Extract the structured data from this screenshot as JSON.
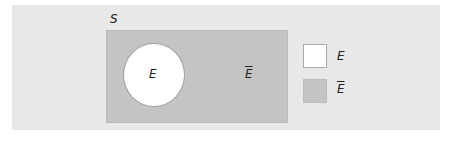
{
  "diagram": {
    "type": "venn",
    "sample_space_label": "S",
    "event_label": "E",
    "complement_label": "E",
    "complement_has_overbar": true,
    "colors": {
      "panel_background": "#e8e8e8",
      "event_fill": "#ffffff",
      "complement_fill": "#c4c4c4"
    },
    "legend": [
      {
        "label": "E",
        "overbar": false,
        "color": "#ffffff"
      },
      {
        "label": "E",
        "overbar": true,
        "color": "#c4c4c4"
      }
    ]
  }
}
